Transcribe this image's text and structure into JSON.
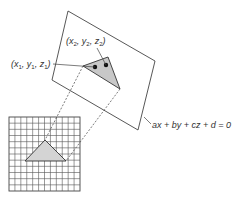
{
  "figure": {
    "colors": {
      "stroke": "#444444",
      "triangle_fill": "#cccccc",
      "grid_line": "#555555",
      "dot": "#111111",
      "background": "#ffffff"
    },
    "plane": {
      "equation": "ax + by + cz + d = 0",
      "corners": [
        [
          68,
          11
        ],
        [
          155,
          61
        ],
        [
          138,
          130
        ],
        [
          52,
          80
        ]
      ]
    },
    "triangle_3d": {
      "vertices": [
        [
          83,
          66
        ],
        [
          108,
          57
        ],
        [
          120,
          89
        ]
      ],
      "points": [
        {
          "label_parts": [
            "x",
            "1",
            ", y",
            "1",
            ", z",
            "1"
          ],
          "at": [
            95,
            67
          ]
        },
        {
          "label_parts": [
            "x",
            "2",
            ", y",
            "2",
            ", z",
            "2"
          ],
          "at": [
            106,
            65
          ]
        }
      ]
    },
    "grid": {
      "x": 9,
      "y": 117,
      "width": 71,
      "height": 74,
      "columns": 12,
      "rows": 12
    },
    "triangle_2d": {
      "vertices": [
        [
          45,
          140
        ],
        [
          25,
          161
        ],
        [
          66,
          161
        ]
      ]
    },
    "projection_lines": [
      [
        [
          83,
          66
        ],
        [
          45,
          140
        ]
      ],
      [
        [
          120,
          89
        ],
        [
          66,
          161
        ]
      ]
    ],
    "labels": {
      "p1": {
        "open": "(",
        "x": "x",
        "x_sub": "1",
        "y": "y",
        "y_sub": "1",
        "z": "z",
        "z_sub": "1",
        "close": ")"
      },
      "p2": {
        "open": "(",
        "x": "x",
        "x_sub": "2",
        "y": "y",
        "y_sub": "2",
        "z": "z",
        "z_sub": "2",
        "close": ")"
      },
      "equation": "ax + by + cz + d = 0"
    }
  }
}
